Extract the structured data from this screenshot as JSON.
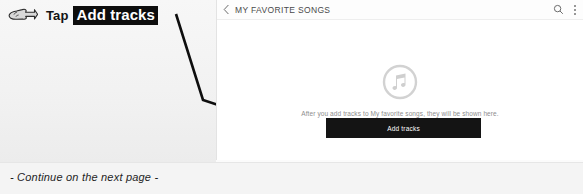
{
  "instruction": {
    "hand_icon": "pointing-hand-icon",
    "action_word": "Tap",
    "target_label": "Add tracks"
  },
  "screenshot": {
    "app_bar": {
      "back_icon": "back-chevron-icon",
      "title": "MY FAVORITE SONGS",
      "search_icon": "search-icon",
      "overflow_icon": "overflow-menu-icon"
    },
    "empty_state": {
      "illustration_icon": "music-note-circle-icon",
      "message": "After you add tracks to My favorite songs, they will be shown here."
    },
    "primary_button": {
      "label": "Add tracks"
    }
  },
  "footer": {
    "note": "- Continue on the next page -"
  },
  "colors": {
    "highlight_background": "#0d0d0d",
    "highlight_text": "#ffffff",
    "button_background": "#141414",
    "button_text": "#ffffff",
    "panel_background": "#ffffff",
    "page_background": "#f2f2f2",
    "icon_gray": "#c9c9c9",
    "body_text_gray": "#8d8d8d"
  }
}
